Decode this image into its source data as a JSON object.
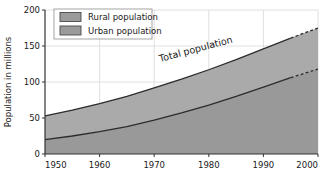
{
  "chart_data": {
    "type": "area",
    "title": "",
    "xlabel": "",
    "ylabel": "Population in millions",
    "xlim": [
      1950,
      2000
    ],
    "ylim": [
      0,
      200
    ],
    "xticks": [
      1950,
      1960,
      1970,
      1980,
      1990,
      2000
    ],
    "yticks": [
      0,
      50,
      100,
      150,
      200
    ],
    "grid": true,
    "stacked": true,
    "legend_position": "top-left",
    "x": [
      1950,
      1955,
      1960,
      1965,
      1970,
      1975,
      1980,
      1985,
      1990,
      1995,
      2000
    ],
    "series": [
      {
        "name": "Urban population",
        "color": "#9a9a9a",
        "values": [
          20,
          25,
          31,
          38,
          47,
          57,
          68,
          80,
          93,
          106,
          118
        ]
      },
      {
        "name": "Rural population",
        "color": "#a8a8a8",
        "values": [
          33,
          36,
          39,
          42,
          45,
          47,
          49,
          51,
          53,
          55,
          57
        ]
      }
    ],
    "total": {
      "name": "Total population",
      "values": [
        53,
        61,
        70,
        80,
        92,
        104,
        117,
        131,
        146,
        161,
        175
      ]
    },
    "projection_starts_at": 1995,
    "annotations": [
      {
        "text": "Total population",
        "x": 1978,
        "y": 128,
        "rotation": -15
      }
    ]
  },
  "legend": {
    "items": [
      {
        "label": "Rural population",
        "swatch_color": "#9b9b9b"
      },
      {
        "label": "Urban population",
        "swatch_color": "#9b9b9b"
      }
    ]
  },
  "axes": {
    "y_title": "Population in millions",
    "y_tick_labels": [
      "0",
      "50",
      "100",
      "150",
      "200"
    ],
    "x_tick_labels": [
      "1950",
      "1960",
      "1970",
      "1980",
      "1990",
      "2000"
    ]
  },
  "colors": {
    "urban_fill": "#999999",
    "rural_fill": "#aaaaaa",
    "background": "#ffffff",
    "grid": "#d8d8d8",
    "axis": "#333333",
    "line": "#2b2b2b"
  }
}
